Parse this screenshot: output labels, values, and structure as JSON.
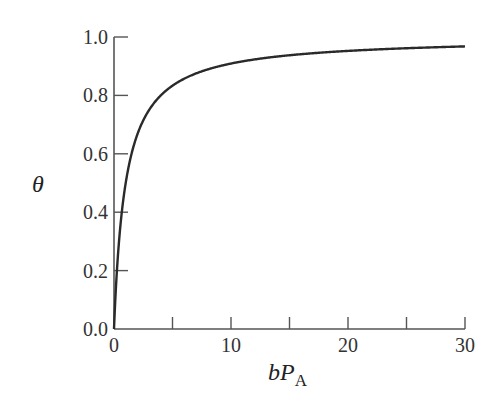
{
  "chart_data": {
    "type": "line",
    "title": "",
    "xlabel": "bP_A",
    "xlabel_parts": {
      "main": "bP",
      "sub": "A"
    },
    "ylabel": "θ",
    "xlim": [
      0,
      30
    ],
    "ylim": [
      0,
      1.0
    ],
    "xticks": [
      0,
      5,
      10,
      15,
      20,
      25,
      30
    ],
    "xtick_labels": [
      "0",
      "",
      "10",
      "",
      "20",
      "",
      "30"
    ],
    "yticks": [
      0.0,
      0.2,
      0.4,
      0.6,
      0.8,
      1.0
    ],
    "ytick_labels": [
      "0.0",
      "0.2",
      "0.4",
      "0.6",
      "0.8",
      "1.0"
    ],
    "grid": false,
    "legend": null,
    "series": [
      {
        "name": "θ = bP_A / (1 + bP_A)",
        "x": [
          0,
          0.5,
          1,
          2,
          3,
          4,
          5,
          7.5,
          10,
          15,
          20,
          25,
          30
        ],
        "y": [
          0.0,
          0.333,
          0.5,
          0.667,
          0.75,
          0.8,
          0.833,
          0.882,
          0.909,
          0.938,
          0.952,
          0.962,
          0.968
        ]
      }
    ],
    "colors": {
      "line": "#2a2a2a",
      "axis": "#555555"
    }
  }
}
